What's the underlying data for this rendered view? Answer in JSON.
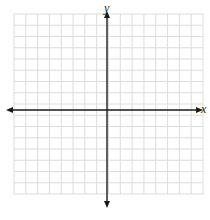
{
  "diagram": {
    "type": "coordinate-grid",
    "axes": {
      "x_label": "x",
      "y_label": "y",
      "axis_color": "#1a1a1a",
      "arrows": "both-ends"
    },
    "grid": {
      "columns": 16,
      "rows": 16,
      "line_color": "#dcdcdc",
      "left": 14,
      "top": 14,
      "right": 203,
      "bottom": 194
    },
    "origin_px": {
      "x": 107,
      "y": 110
    }
  }
}
